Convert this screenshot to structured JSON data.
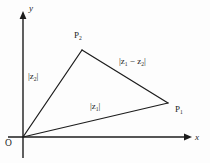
{
  "figure": {
    "type": "complex-plane-triangle-diagram",
    "background_color": "#fdfdfd",
    "stroke_color": "#1c1c1c"
  },
  "axes": {
    "y_label": "y",
    "x_label": "x",
    "origin_label": "O",
    "y_axis": {
      "x": 23,
      "y_top": 16,
      "y_bottom": 158,
      "arrow": "up"
    },
    "x_axis": {
      "y": 137,
      "x_left": 8,
      "x_right": 192,
      "arrow": "right"
    }
  },
  "vertices": [
    {
      "name": "origin",
      "label": "O",
      "x": 23,
      "y": 137
    },
    {
      "name": "point-1",
      "label": "P",
      "sub": "1",
      "x": 168,
      "y": 103
    },
    {
      "name": "point-2",
      "label": "P",
      "sub": "2",
      "x": 82,
      "y": 50
    }
  ],
  "sides": [
    {
      "name": "side-z1",
      "from": "origin",
      "to": "point-1",
      "label_main": "|z",
      "label_sub": "1",
      "label_end": "|"
    },
    {
      "name": "side-z2",
      "from": "origin",
      "to": "point-2",
      "label_main": "|z",
      "label_sub": "2",
      "label_end": "|"
    },
    {
      "name": "side-z1-z2",
      "from": "point-2",
      "to": "point-1",
      "label_main": "|z",
      "label_sub": "1",
      "label_mid": " − z",
      "label_sub2": "2",
      "label_end": "|"
    }
  ],
  "labels": {
    "y": "y",
    "x": "x",
    "O": "O",
    "P_letter": "P",
    "P1_sub": "1",
    "P2_sub": "2",
    "mod_open": "|",
    "mod_close": "|",
    "z_letter": "z",
    "sub_1": "1",
    "sub_2": "2",
    "minus_z": " − z"
  }
}
